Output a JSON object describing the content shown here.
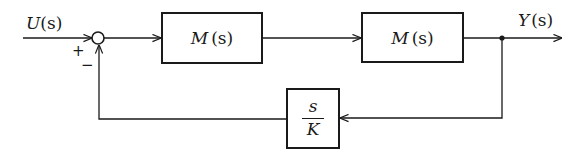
{
  "diagram": {
    "type": "feedback-control-block-diagram",
    "input": {
      "label_var": "U",
      "label_arg": "(s)"
    },
    "output": {
      "label_var": "Y",
      "label_arg": "(s)"
    },
    "summing_junction": {
      "plus_sign": "+",
      "minus_sign": "−"
    },
    "forward_blocks": [
      {
        "var": "M",
        "arg": "(s)"
      },
      {
        "var": "M",
        "arg": "(s)"
      }
    ],
    "feedback_block": {
      "numerator": "s",
      "denominator": "K"
    },
    "colors": {
      "ink": "#1a1a1a",
      "background": "#ffffff"
    }
  }
}
